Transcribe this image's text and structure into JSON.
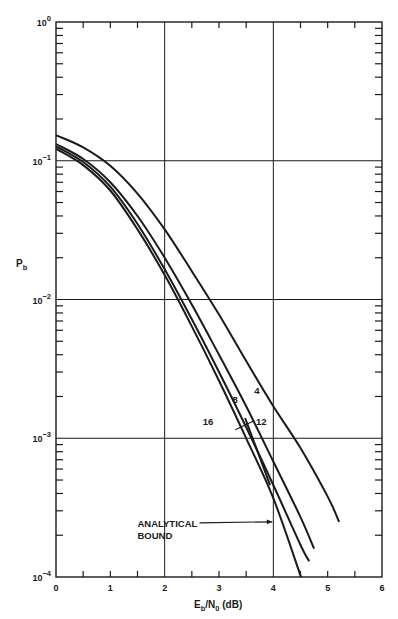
{
  "header": {
    "text": ""
  },
  "chart_data": {
    "type": "line",
    "title": "",
    "xlabel": "Eb/N0 (dB)",
    "xlabel_parts": {
      "main": "E",
      "sub1": "b",
      "mid": "/N",
      "sub2": "0",
      "tail": " (dB)"
    },
    "ylabel": "Pb",
    "ylabel_parts": {
      "main": "P",
      "sub": "b"
    },
    "xlim": [
      0,
      6
    ],
    "ylim": [
      0.0001,
      1
    ],
    "yscale": "log",
    "grid": {
      "x_major": [
        2,
        4
      ],
      "y_major": [
        0.1,
        0.01,
        0.001
      ]
    },
    "x_ticks": [
      "0",
      "1",
      "2",
      "3",
      "4",
      "5",
      "6"
    ],
    "y_ticks": [
      {
        "base": "10",
        "exp": "0",
        "value": 1
      },
      {
        "base": "10",
        "exp": "−1",
        "value": 0.1
      },
      {
        "base": "10",
        "exp": "−2",
        "value": 0.01
      },
      {
        "base": "10",
        "exp": "−3",
        "value": 0.001
      },
      {
        "base": "10",
        "exp": "−4",
        "value": 0.0001
      }
    ],
    "series": [
      {
        "name": "4",
        "x": [
          0,
          0.5,
          1.0,
          1.5,
          2.0,
          2.5,
          3.0,
          3.5,
          4.0,
          4.5,
          5.0,
          5.21
        ],
        "y": [
          0.153,
          0.125,
          0.092,
          0.058,
          0.032,
          0.016,
          0.0078,
          0.0036,
          0.0017,
          0.00085,
          0.00038,
          0.00025
        ]
      },
      {
        "name": "8",
        "x": [
          0,
          0.5,
          1.0,
          1.5,
          2.0,
          2.5,
          3.0,
          3.5,
          4.0,
          4.5,
          4.75
        ],
        "y": [
          0.132,
          0.103,
          0.07,
          0.04,
          0.02,
          0.0092,
          0.004,
          0.0017,
          0.00068,
          0.00027,
          0.00016
        ]
      },
      {
        "name": "12",
        "x": [
          0,
          0.5,
          1.0,
          1.5,
          2.0,
          2.5,
          3.0,
          3.5,
          4.0,
          4.5,
          4.66
        ],
        "y": [
          0.127,
          0.098,
          0.065,
          0.035,
          0.0165,
          0.0072,
          0.003,
          0.0012,
          0.00046,
          0.00017,
          0.00013
        ]
      },
      {
        "name": "16",
        "x": [
          0,
          0.5,
          1.0,
          1.5,
          2.0,
          2.5,
          3.0,
          3.5,
          4.0,
          4.51
        ],
        "y": [
          0.122,
          0.093,
          0.061,
          0.032,
          0.015,
          0.0064,
          0.0026,
          0.001,
          0.00037,
          0.0001
        ]
      },
      {
        "name": "ANALYTICAL BOUND",
        "x": [
          3.48,
          3.94
        ],
        "y": [
          0.0014,
          0.00046
        ]
      }
    ],
    "annotations": [
      {
        "text": "4",
        "x": 3.65,
        "y": 0.0021
      },
      {
        "text": "8",
        "x": 3.25,
        "y": 0.0018
      },
      {
        "text": "12",
        "x": 3.68,
        "y": 0.00125,
        "leader_to": [
          3.3,
          0.00115
        ]
      },
      {
        "text": "16",
        "x": 2.7,
        "y": 0.00125
      },
      {
        "text": "ANALYTICAL",
        "line2": "BOUND",
        "x": 1.5,
        "y": 0.00023,
        "arrow_to": [
          4.0,
          0.00025
        ]
      }
    ],
    "legend": null
  }
}
